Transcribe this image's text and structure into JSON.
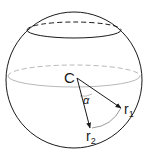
{
  "diagram": {
    "center_label": "C",
    "vector1_label": "r",
    "vector1_subscript": "1",
    "vector2_label": "r",
    "vector2_subscript": "2",
    "angle_label": "α",
    "colors": {
      "outline": "#1a1a1a",
      "equator": "#b0b0b0",
      "arc": "#9a9a9a"
    }
  }
}
